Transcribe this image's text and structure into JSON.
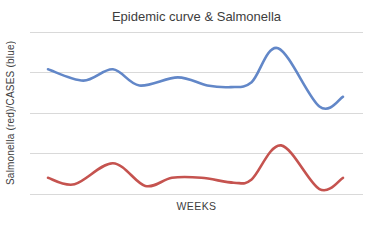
{
  "chart_data": {
    "type": "line",
    "title": "Epidemic curve & Salmonella",
    "xlabel": "WEEKS",
    "ylabel": "Salmonella (red)/CASES (blue)",
    "grid": true,
    "gridlines_horizontal": 5,
    "x_tick_labels": [],
    "y_tick_labels": [],
    "legend_position": "none",
    "smooth": true,
    "ylim": [
      0,
      100
    ],
    "background_color": "#ffffff",
    "gridline_color": "#d9d9d9",
    "text_color": "#3d3d3d",
    "series": [
      {
        "name": "CASES",
        "color_name": "blue",
        "color": "#6287c8",
        "x": [
          1,
          2.2,
          3.2,
          4.1,
          5.4,
          6.4,
          7.2,
          7.9,
          8.8,
          10.2,
          11
        ],
        "values": [
          77,
          70,
          77,
          67,
          72,
          67,
          66,
          69,
          90,
          54,
          60
        ]
      },
      {
        "name": "Salmonella",
        "color_name": "red",
        "color": "#c5534f",
        "x": [
          1,
          1.9,
          3.2,
          4.3,
          5.2,
          6.2,
          7.3,
          7.9,
          8.9,
          10.2,
          11
        ],
        "values": [
          10,
          6,
          19,
          5,
          10,
          10,
          7,
          9,
          30,
          3,
          10
        ]
      }
    ]
  }
}
